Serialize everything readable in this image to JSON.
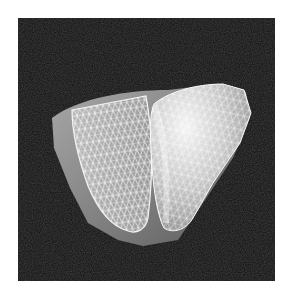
{
  "figure": {
    "background_color": "#0e0e0e",
    "outer_shell_color": "#8a8a8a",
    "left_ventricle_mesh_color": "#e8e8e8",
    "right_ventricle_mesh_color": "#f0f0f0"
  }
}
